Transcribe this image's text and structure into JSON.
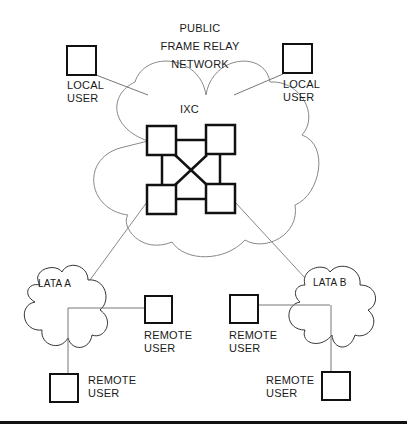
{
  "title": {
    "line1": "PUBLIC",
    "line2": "FRAME RELAY",
    "line3": "NETWORK"
  },
  "core": {
    "label": "IXC"
  },
  "local_users": [
    {
      "line1": "LOCAL",
      "line2": "USER"
    },
    {
      "line1": "LOCAL",
      "line2": "USER"
    }
  ],
  "latas": [
    {
      "label": "LATA A"
    },
    {
      "label": "LATA B"
    }
  ],
  "remote_users": [
    {
      "line1": "REMOTE",
      "line2": "USER"
    },
    {
      "line1": "REMOTE",
      "line2": "USER"
    },
    {
      "line1": "REMOTE",
      "line2": "USER"
    },
    {
      "line1": "REMOTE",
      "line2": "USER"
    }
  ],
  "colors": {
    "stroke": "#111111",
    "thin": "#777777"
  }
}
